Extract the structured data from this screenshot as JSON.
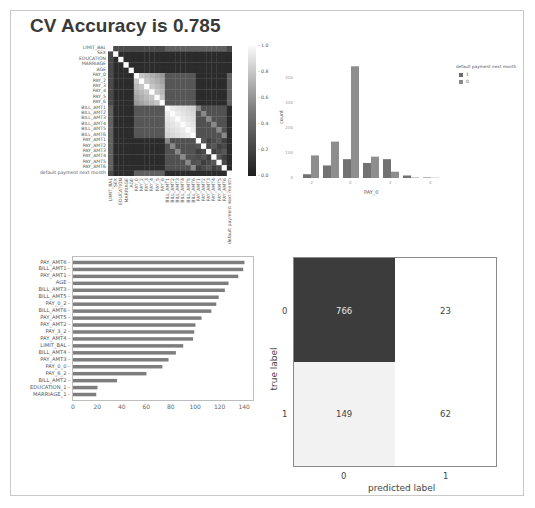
{
  "page": {
    "title": "CV Accuracy is 0.785"
  },
  "chart_data": [
    {
      "type": "heatmap",
      "title": "",
      "labels": [
        "LIMIT_BAL",
        "SEX",
        "EDUCATION",
        "MARRIAGE",
        "AGE",
        "PAY_0",
        "PAY_2",
        "PAY_3",
        "PAY_4",
        "PAY_5",
        "PAY_6",
        "BILL_AMT1",
        "BILL_AMT2",
        "BILL_AMT3",
        "BILL_AMT4",
        "BILL_AMT5",
        "BILL_AMT6",
        "PAY_AMT1",
        "PAY_AMT2",
        "PAY_AMT3",
        "PAY_AMT4",
        "PAY_AMT5",
        "PAY_AMT6",
        "default payment next month"
      ],
      "colorbar": {
        "ticks": [
          "1.0",
          "0.8",
          "0.6",
          "0.4",
          "0.2",
          "0.0"
        ],
        "range": [
          0.0,
          1.0
        ]
      },
      "colormap": "grayscale (dark = 0, white = 1)",
      "notes": "Correlation matrix; diagonal = 1.0; strong block among PAY_0..PAY_6 (~0.5-0.8) and BILL_AMT1..BILL_AMT6 (~0.8-0.95)"
    },
    {
      "type": "bar",
      "title": "",
      "xlabel": "PAY_0",
      "ylabel": "count",
      "categories": [
        "-2",
        "-1",
        "0",
        "1",
        "2",
        "3",
        "4"
      ],
      "x_tick_labels": [
        "-2",
        "0",
        "2",
        "4"
      ],
      "y_ticks": [
        "0",
        "100",
        "200",
        "300",
        "400"
      ],
      "legend": {
        "title": "default payment next month",
        "entries": [
          "1",
          "0"
        ],
        "position": "right"
      },
      "series": [
        {
          "name": "1",
          "values": [
            15,
            50,
            75,
            60,
            75,
            10,
            2
          ]
        },
        {
          "name": "0",
          "values": [
            90,
            145,
            445,
            85,
            25,
            2,
            1
          ]
        }
      ],
      "ylim": [
        0,
        470
      ]
    },
    {
      "type": "bar",
      "orientation": "horizontal",
      "title": "",
      "xlabel": "",
      "ylabel": "",
      "categories": [
        "PAY_AMT6",
        "BILL_AMT1",
        "PAY_AMT1",
        "AGE",
        "BILL_AMT3",
        "BILL_AMT5",
        "PAY_0_2",
        "BILL_AMT6",
        "PAY_AMT5",
        "PAY_AMT2",
        "PAY_3_2",
        "PAY_AMT4",
        "LIMIT_BAL",
        "BILL_AMT4",
        "PAY_AMT3",
        "PAY_0_0",
        "PAY_6_2",
        "BILL_AMT2",
        "EDUCATION_1",
        "MARRIAGE_1"
      ],
      "values": [
        140,
        139,
        135,
        127,
        124,
        119,
        117,
        113,
        105,
        100,
        99,
        98,
        90,
        84,
        78,
        73,
        60,
        36,
        20,
        19
      ],
      "x_ticks": [
        "0",
        "20",
        "40",
        "60",
        "80",
        "100",
        "120",
        "140"
      ],
      "xlim": [
        0,
        147
      ]
    },
    {
      "type": "heatmap",
      "subtype": "confusion_matrix",
      "title": "",
      "xlabel": "predicted label",
      "ylabel": "true label",
      "x_tick_labels": [
        "0",
        "1"
      ],
      "y_tick_labels": [
        "0",
        "1"
      ],
      "values": [
        [
          766,
          23
        ],
        [
          149,
          62
        ]
      ]
    }
  ],
  "heatmap": {
    "labels": [
      "LIMIT_BAL",
      "SEX",
      "EDUCATION",
      "MARRIAGE",
      "AGE",
      "PAY_0",
      "PAY_2",
      "PAY_3",
      "PAY_4",
      "PAY_5",
      "PAY_6",
      "BILL_AMT1",
      "BILL_AMT2",
      "BILL_AMT3",
      "BILL_AMT4",
      "BILL_AMT5",
      "BILL_AMT6",
      "PAY_AMT1",
      "PAY_AMT2",
      "PAY_AMT3",
      "PAY_AMT4",
      "PAY_AMT5",
      "PAY_AMT6",
      "default payment next month"
    ],
    "colorbar_ticks": [
      "1.0",
      "0.8",
      "0.6",
      "0.4",
      "0.2",
      "0.0"
    ]
  },
  "countplot": {
    "xlabel": "PAY_0",
    "ylabel": "count",
    "x_ticks": [
      "-2",
      "0",
      "2",
      "4"
    ],
    "y_ticks": [
      "0",
      "100",
      "200",
      "300",
      "400"
    ],
    "legend_title": "default payment next month",
    "legend_entries": [
      "1",
      "0"
    ]
  },
  "importance": {
    "x_ticks": [
      "0",
      "20",
      "40",
      "60",
      "80",
      "100",
      "120",
      "140"
    ]
  },
  "confusion": {
    "xlabel": "predicted label",
    "ylabel": "true label",
    "x_ticks": [
      "0",
      "1"
    ],
    "y_ticks": [
      "0",
      "1"
    ],
    "cells": [
      "766",
      "23",
      "149",
      "62"
    ]
  }
}
